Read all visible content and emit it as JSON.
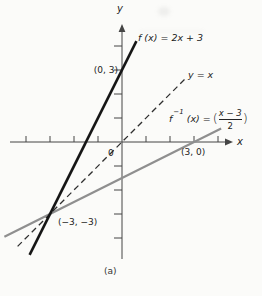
{
  "theme": {
    "background": "#fbfbf9",
    "axis_color": "#454545",
    "text_color": "#222222"
  },
  "figure": {
    "caption": "(a)"
  },
  "labels": {
    "y_axis": "y",
    "x_axis": "x",
    "f": "f (x) = 2x + 3",
    "yx": "y = x",
    "finv_f": "f",
    "finv_exp": "−1",
    "finv_rest": "(x) =",
    "finv_open": "(",
    "finv_num": "x − 3",
    "finv_den": "2",
    "finv_close": ")",
    "p03": "(0, 3)",
    "p30": "(3, 0)",
    "pm3": "(−3, −3)",
    "origin": "0",
    "caption": "(a)"
  },
  "chart_data": {
    "type": "line",
    "title": "",
    "xlabel": "x",
    "ylabel": "y",
    "xlim": [
      -4.7,
      4.6
    ],
    "ylim": [
      -4.9,
      4.9
    ],
    "xticks": [
      -4,
      -3,
      -2,
      -1,
      1,
      2,
      3,
      4
    ],
    "yticks": [
      -4,
      -3,
      -2,
      -1,
      1,
      2,
      3,
      4
    ],
    "grid": false,
    "legend": "inline-labels",
    "series": [
      {
        "name": "f(x) = 2x + 3",
        "equation": "f(x) = 2x + 3",
        "style": "solid",
        "color": "#161616",
        "width": 2.6,
        "points": [
          [
            -3.85,
            -4.7
          ],
          [
            0.6,
            4.2
          ]
        ]
      },
      {
        "name": "y = x",
        "equation": "y = x",
        "style": "dashed",
        "color": "#2e2e2e",
        "width": 1.3,
        "points": [
          [
            -4.35,
            -4.35
          ],
          [
            2.63,
            2.63
          ]
        ]
      },
      {
        "name": "f⁻¹(x) = (x − 3)/2",
        "equation": "f⁻¹(x) = (x − 3)/2",
        "style": "solid",
        "color": "#8f8f8f",
        "width": 2.2,
        "points": [
          [
            -4.9,
            -3.95
          ],
          [
            4.13,
            0.56
          ]
        ]
      }
    ],
    "annotated_points": [
      {
        "label": "(0, 3)",
        "x": 0,
        "y": 3
      },
      {
        "label": "(3, 0)",
        "x": 3,
        "y": 0
      },
      {
        "label": "(−3, −3)",
        "x": -3,
        "y": -3
      }
    ],
    "origin_label": "0",
    "subfigure_label": "(a)"
  }
}
